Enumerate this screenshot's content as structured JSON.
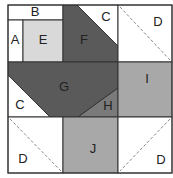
{
  "diagram": {
    "labels": {
      "A": "A",
      "B": "B",
      "C_top": "C",
      "C_left": "C",
      "D_top_right": "D",
      "D_bottom_left": "D",
      "D_bottom_right": "D",
      "E": "E",
      "F": "F",
      "G": "G",
      "H": "H",
      "I": "I",
      "J": "J"
    },
    "colors": {
      "white": "#ffffff",
      "light_gray": "#d9d9d9",
      "medium_gray": "#a8a8a8",
      "dark_gray": "#5a5a5a",
      "mid_dark_gray": "#7a7a7a",
      "outline": "#333333",
      "dashed": "#888888"
    }
  }
}
